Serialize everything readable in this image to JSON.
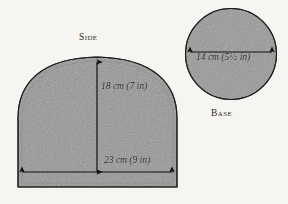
{
  "figure": {
    "title_side": "Side",
    "title_base": "Base",
    "background_color": "#f6f5f1",
    "fill_color": "#a9a9a9",
    "outline_color": "#1f1f1f",
    "arrow_color": "#111111"
  },
  "shapes": {
    "side": {
      "name": "Side",
      "type": "dome",
      "height": {
        "text": "18 cm (7 in)",
        "metric_value": 18,
        "metric_unit": "cm",
        "imperial_value": 7,
        "imperial_unit": "in"
      },
      "width": {
        "text": "23 cm (9 in)",
        "metric_value": 23,
        "metric_unit": "cm",
        "imperial_value": 9,
        "imperial_unit": "in"
      }
    },
    "base": {
      "name": "Base",
      "type": "circle",
      "diameter": {
        "text_metric": "14 cm",
        "metric_value": 14,
        "metric_unit": "cm",
        "imperial_whole": "5",
        "imperial_frac_num": "1",
        "imperial_frac_den": "2",
        "imperial_unit": "in",
        "text_full": "14 cm (5 1/2 in)"
      }
    }
  },
  "icons": {
    "arrow_vertical": "double-arrow-vertical-icon",
    "arrow_horizontal": "double-arrow-horizontal-icon",
    "arrow_diameter": "double-arrow-horizontal-icon"
  }
}
